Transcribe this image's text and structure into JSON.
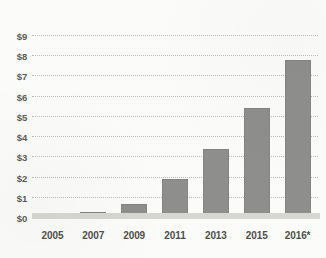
{
  "chart_data": {
    "type": "bar",
    "title": "",
    "subtitle": "",
    "xlabel": "",
    "ylabel": "",
    "categories": [
      "2005",
      "2007",
      "2009",
      "2011",
      "2013",
      "2015",
      "2016*"
    ],
    "values": [
      0.15,
      0.3,
      0.7,
      1.95,
      3.4,
      5.45,
      7.8
    ],
    "ylim": [
      0,
      9
    ],
    "ytick_labels": [
      "$0",
      "$1",
      "$2",
      "$3",
      "$4",
      "$5",
      "$6",
      "$7",
      "$8",
      "$9"
    ],
    "ytick_values": [
      0,
      1,
      2,
      3,
      4,
      5,
      6,
      7,
      8,
      9
    ],
    "grid": true,
    "grid_style": "dotted",
    "legend": "none",
    "annotations": [
      "* asterisk on 2016 label indicates projected or partial-year value"
    ],
    "series": [
      {
        "name": "value",
        "values": [
          0.15,
          0.3,
          0.7,
          1.95,
          3.4,
          5.45,
          7.8
        ]
      }
    ],
    "colors": {
      "bar": "#8e8e8c",
      "bar_border": "#848481",
      "gridline": "#b9b9b5",
      "baseline": "#d6d6d2",
      "background": "#fbfbf9",
      "label_text": "#4f4f4d"
    }
  }
}
